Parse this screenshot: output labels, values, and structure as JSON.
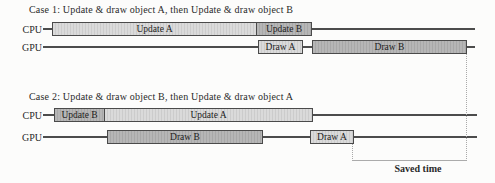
{
  "figure": {
    "case1": {
      "title": "Case 1: Update & draw object A, then Update & draw object B",
      "rows": [
        {
          "label": "CPU",
          "blocks": [
            {
              "label": "Update A",
              "shade": "light"
            },
            {
              "label": "Update B",
              "shade": "dark"
            }
          ]
        },
        {
          "label": "GPU",
          "blocks": [
            {
              "label": "Draw A",
              "shade": "light"
            },
            {
              "label": "Draw B",
              "shade": "dark"
            }
          ]
        }
      ]
    },
    "case2": {
      "title": "Case 2: Update & draw object B, then Update & draw object A",
      "rows": [
        {
          "label": "CPU",
          "blocks": [
            {
              "label": "Update B",
              "shade": "dark"
            },
            {
              "label": "Update A",
              "shade": "light"
            }
          ]
        },
        {
          "label": "GPU",
          "blocks": [
            {
              "label": "Draw B",
              "shade": "dark"
            },
            {
              "label": "Draw A",
              "shade": "light"
            }
          ]
        }
      ]
    },
    "annotation": {
      "saved_time": "Saved time"
    },
    "colors": {
      "light_block": "#dadada",
      "light_block_hatch": "#cccccc",
      "dark_block": "#b6b6b6",
      "dark_block_hatch": "#a8a8a8",
      "block_border": "#4a4a4a",
      "timeline": "#4c4c4c",
      "dotted_guide": "#a9a9a9",
      "bracket": "#ababab",
      "text": "#2a2a2a"
    }
  }
}
